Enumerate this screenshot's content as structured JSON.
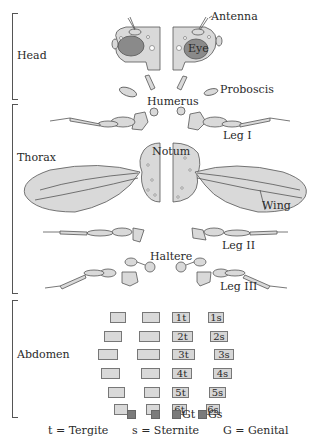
{
  "regions": {
    "head": "Head",
    "thorax": "Thorax",
    "abdomen": "Abdomen"
  },
  "labels": {
    "antenna": "Antenna",
    "eye": "Eye",
    "proboscis": "Proboscis",
    "humerus": "Humerus",
    "leg1": "Leg I",
    "notum": "Notum",
    "wing": "Wing",
    "leg2": "Leg II",
    "haltere": "Haltere",
    "leg3": "Leg III"
  },
  "abdomen": {
    "tergites": [
      "1t",
      "2t",
      "3t",
      "4t",
      "5t",
      "6t"
    ],
    "sternites": [
      "1s",
      "2s",
      "3s",
      "4s",
      "5s",
      "6s"
    ],
    "genital_tergite": "Gt",
    "genital_sternite": "Gs"
  },
  "legend": {
    "tergite": "t = Tergite",
    "sternite": "s = Sternite",
    "genital": "G = Genital"
  },
  "colors": {
    "fill": "#d9d9d9",
    "eye": "#8a8a8a",
    "genital": "#7b7b7b",
    "stroke": "#555555"
  }
}
